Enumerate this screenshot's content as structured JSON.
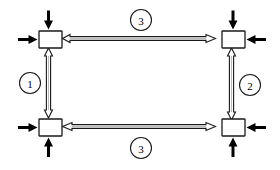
{
  "diagram": {
    "type": "structural-frame-load-diagram",
    "background_color": "#ffffff",
    "line_color": "#1a1a1a",
    "arrow_color": "#000000",
    "members": [
      {
        "id": "member-left",
        "label": "1",
        "orientation": "vertical",
        "position": "left"
      },
      {
        "id": "member-right",
        "label": "2",
        "orientation": "vertical",
        "position": "right"
      },
      {
        "id": "member-top",
        "label": "3",
        "orientation": "horizontal",
        "position": "top"
      },
      {
        "id": "member-bottom",
        "label": "3",
        "orientation": "horizontal",
        "position": "bottom"
      }
    ],
    "nodes": [
      {
        "id": "node-top-left",
        "position": "top-left"
      },
      {
        "id": "node-top-right",
        "position": "top-right"
      },
      {
        "id": "node-bottom-left",
        "position": "bottom-left"
      },
      {
        "id": "node-bottom-right",
        "position": "bottom-right"
      }
    ],
    "load_arrows": [
      {
        "id": "arrow-top-left-down",
        "at_node": "top-left",
        "direction": "down"
      },
      {
        "id": "arrow-top-left-right",
        "at_node": "top-left",
        "direction": "right"
      },
      {
        "id": "arrow-top-right-down",
        "at_node": "top-right",
        "direction": "down"
      },
      {
        "id": "arrow-top-right-left",
        "at_node": "top-right",
        "direction": "left"
      },
      {
        "id": "arrow-bottom-left-up",
        "at_node": "bottom-left",
        "direction": "up"
      },
      {
        "id": "arrow-bottom-left-right",
        "at_node": "bottom-left",
        "direction": "right"
      },
      {
        "id": "arrow-bottom-right-up",
        "at_node": "bottom-right",
        "direction": "up"
      },
      {
        "id": "arrow-bottom-right-left",
        "at_node": "bottom-right",
        "direction": "left"
      }
    ],
    "labels": {
      "left_member": "1",
      "right_member": "2",
      "top_member": "3",
      "bottom_member": "3"
    }
  }
}
